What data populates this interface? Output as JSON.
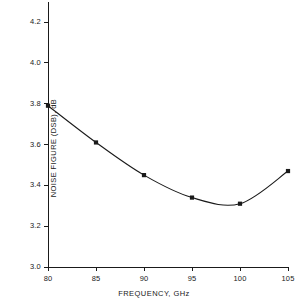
{
  "chart_data": {
    "type": "line",
    "title": "",
    "subtitle": "",
    "xlabel": "FREQUENCY, GHz",
    "ylabel": "NOISE FIGURE (DSB), dB",
    "x": [
      80,
      85,
      90,
      95,
      100,
      105
    ],
    "values": [
      3.79,
      3.61,
      3.45,
      3.34,
      3.31,
      3.47
    ],
    "series": [
      {
        "name": "Noise figure (DSB)",
        "x": [
          80,
          85,
          90,
          95,
          100,
          105
        ],
        "values": [
          3.79,
          3.61,
          3.45,
          3.34,
          3.31,
          3.47
        ]
      }
    ],
    "xlim": [
      80,
      105
    ],
    "ylim": [
      3.0,
      4.2
    ],
    "xticks": [
      80,
      85,
      90,
      95,
      100,
      105
    ],
    "yticks": [
      3.0,
      3.2,
      3.4,
      3.6,
      3.8,
      4.0,
      4.2
    ],
    "xtick_labels": [
      "80",
      "85",
      "90",
      "95",
      "100",
      "105"
    ],
    "ytick_labels": [
      "3.0",
      "3.2",
      "3.4",
      "3.6",
      "3.8",
      "4.0",
      "4.2"
    ],
    "grid": false,
    "legend": null,
    "legend_position": "none",
    "annotations": [],
    "marker": "square",
    "line_color": "#1a1a1a",
    "marker_color": "#1a1a1a",
    "axis_color": "#1a1a1a",
    "background_color": "#ffffff"
  }
}
